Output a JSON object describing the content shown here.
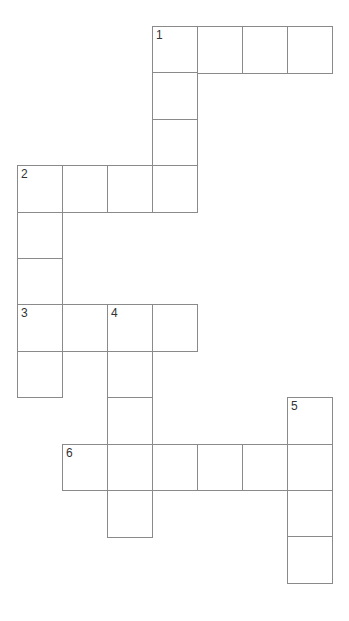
{
  "puzzle": {
    "type": "crossword",
    "colors": {
      "border": "#8a8a8a",
      "background": "#ffffff",
      "number": "#333333"
    },
    "grid": {
      "origin_x": 17,
      "origin_y": 26,
      "cell_w": 45,
      "cell_h": 46.4
    },
    "cells": [
      {
        "c": 3,
        "r": 0,
        "n": "1"
      },
      {
        "c": 4,
        "r": 0
      },
      {
        "c": 5,
        "r": 0
      },
      {
        "c": 6,
        "r": 0
      },
      {
        "c": 3,
        "r": 1
      },
      {
        "c": 3,
        "r": 2
      },
      {
        "c": 0,
        "r": 3,
        "n": "2"
      },
      {
        "c": 1,
        "r": 3
      },
      {
        "c": 2,
        "r": 3
      },
      {
        "c": 3,
        "r": 3
      },
      {
        "c": 0,
        "r": 4
      },
      {
        "c": 0,
        "r": 5
      },
      {
        "c": 0,
        "r": 6,
        "n": "3"
      },
      {
        "c": 1,
        "r": 6
      },
      {
        "c": 2,
        "r": 6,
        "n": "4"
      },
      {
        "c": 3,
        "r": 6
      },
      {
        "c": 0,
        "r": 7
      },
      {
        "c": 2,
        "r": 7
      },
      {
        "c": 2,
        "r": 8
      },
      {
        "c": 6,
        "r": 8,
        "n": "5"
      },
      {
        "c": 1,
        "r": 9,
        "n": "6"
      },
      {
        "c": 2,
        "r": 9
      },
      {
        "c": 3,
        "r": 9
      },
      {
        "c": 4,
        "r": 9
      },
      {
        "c": 5,
        "r": 9
      },
      {
        "c": 6,
        "r": 9
      },
      {
        "c": 2,
        "r": 10
      },
      {
        "c": 6,
        "r": 10
      },
      {
        "c": 6,
        "r": 11
      }
    ],
    "entries": [
      {
        "number": "1",
        "direction": "across",
        "length": 4
      },
      {
        "number": "1",
        "direction": "down",
        "length": 4
      },
      {
        "number": "2",
        "direction": "across",
        "length": 4
      },
      {
        "number": "2",
        "direction": "down",
        "length": 5
      },
      {
        "number": "3",
        "direction": "across",
        "length": 4
      },
      {
        "number": "4",
        "direction": "down",
        "length": 5
      },
      {
        "number": "5",
        "direction": "down",
        "length": 4
      },
      {
        "number": "6",
        "direction": "across",
        "length": 6
      }
    ]
  }
}
